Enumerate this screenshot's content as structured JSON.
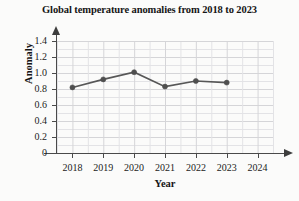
{
  "chart_data": {
    "type": "line",
    "title": "Global temperature anomalies from 2018 to 2023",
    "xlabel": "Year",
    "ylabel": "Anomaly",
    "x": [
      2018,
      2019,
      2020,
      2021,
      2022,
      2023
    ],
    "values": [
      0.82,
      0.92,
      1.01,
      0.83,
      0.9,
      0.88
    ],
    "series": [
      {
        "name": "Anomaly",
        "values": [
          0.82,
          0.92,
          1.01,
          0.83,
          0.9,
          0.88
        ]
      }
    ],
    "xlim": [
      2017.5,
      2024.5
    ],
    "ylim": [
      0,
      1.5
    ],
    "x_ticks": [
      2018,
      2019,
      2020,
      2021,
      2022,
      2023,
      2024
    ],
    "x_tick_labels": [
      "2018",
      "2019",
      "2020",
      "2021",
      "2022",
      "2023",
      "2024"
    ],
    "y_ticks": [
      0,
      0.2,
      0.4,
      0.6,
      0.8,
      1.0,
      1.2,
      1.4
    ],
    "y_tick_labels": [
      "0",
      "0.2",
      "0.4",
      "0.6",
      "0.8",
      "1.0",
      "1.2",
      "1.4"
    ],
    "grid": true,
    "grid_minor": true,
    "legend": "none",
    "marker": "circle",
    "line_color": "#575757",
    "marker_color": "#4f4f4f",
    "grid_color": "#d5d5d8",
    "axis_color": "#4a4a4a",
    "background_color": "#fbfbfa"
  }
}
